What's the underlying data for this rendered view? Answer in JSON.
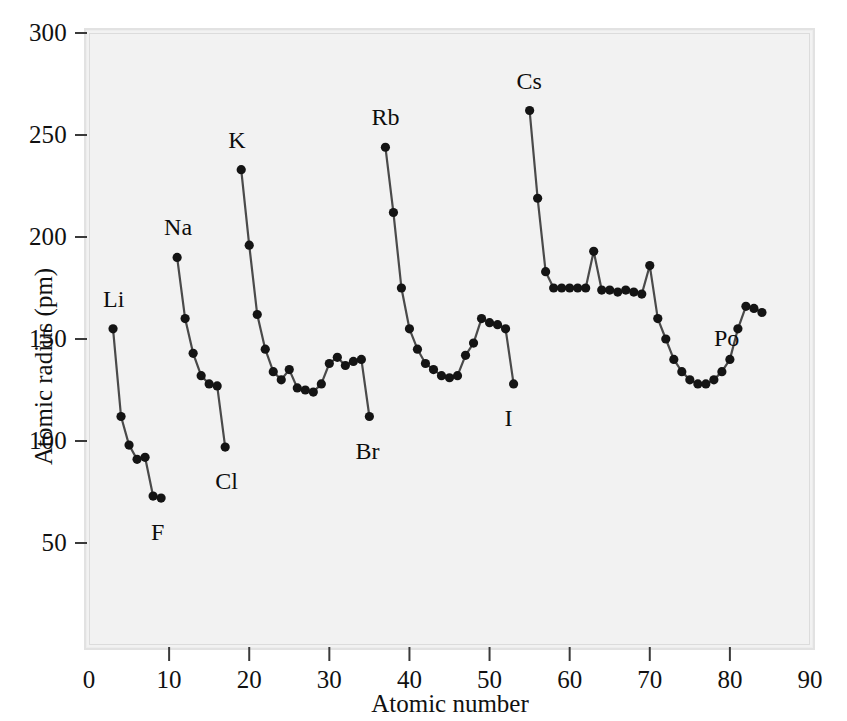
{
  "chart_data": {
    "type": "line",
    "title": "",
    "xlabel": "Atomic number",
    "ylabel": "Atomic radius (pm)",
    "xlim": [
      0,
      90
    ],
    "ylim": [
      0,
      300
    ],
    "xticks": [
      0,
      10,
      20,
      30,
      40,
      50,
      60,
      70,
      80,
      90
    ],
    "yticks": [
      50,
      100,
      150,
      200,
      250,
      300
    ],
    "grid": false,
    "legend": "none",
    "marker": "filled-circle",
    "series": [
      {
        "name": "period-2",
        "x": [
          3,
          4,
          5,
          6,
          7,
          8,
          9
        ],
        "values": [
          155,
          112,
          98,
          91,
          92,
          73,
          72
        ]
      },
      {
        "name": "period-3",
        "x": [
          11,
          12,
          13,
          14,
          15,
          16,
          17
        ],
        "values": [
          190,
          160,
          143,
          132,
          128,
          127,
          97
        ]
      },
      {
        "name": "period-4",
        "x": [
          19,
          20,
          21,
          22,
          23,
          24,
          25,
          26,
          27,
          28,
          29,
          30,
          31,
          32,
          33,
          34,
          35
        ],
        "values": [
          233,
          196,
          162,
          145,
          134,
          130,
          135,
          126,
          125,
          124,
          128,
          138,
          141,
          137,
          139,
          140,
          112
        ]
      },
      {
        "name": "period-5",
        "x": [
          37,
          38,
          39,
          40,
          41,
          42,
          43,
          44,
          45,
          46,
          47,
          48,
          49,
          50,
          51,
          52,
          53
        ],
        "values": [
          244,
          212,
          175,
          155,
          145,
          138,
          135,
          132,
          131,
          132,
          142,
          148,
          160,
          158,
          157,
          155,
          128
        ]
      },
      {
        "name": "period-6",
        "x": [
          55,
          56,
          57,
          58,
          59,
          60,
          61,
          62,
          63,
          64,
          65,
          66,
          67,
          68,
          69,
          70,
          71,
          72,
          73,
          74,
          75,
          76,
          77,
          78,
          79,
          80,
          81,
          82,
          83,
          84
        ],
        "values": [
          262,
          219,
          183,
          175,
          175,
          175,
          175,
          175,
          193,
          174,
          174,
          173,
          174,
          173,
          172,
          186,
          160,
          150,
          140,
          134,
          130,
          128,
          128,
          130,
          134,
          140,
          155,
          166,
          165,
          163
        ]
      }
    ],
    "point_labels": [
      {
        "text": "Li",
        "x": 3,
        "y": 155,
        "dx": -2,
        "dy": -30
      },
      {
        "text": "F",
        "x": 9,
        "y": 72,
        "dx": -2,
        "dy": 34
      },
      {
        "text": "Na",
        "x": 11,
        "y": 190,
        "dx": -5,
        "dy": -30
      },
      {
        "text": "Cl",
        "x": 17,
        "y": 97,
        "dx": -2,
        "dy": 34
      },
      {
        "text": "K",
        "x": 19,
        "y": 233,
        "dx": -5,
        "dy": -30
      },
      {
        "text": "Br",
        "x": 35,
        "y": 112,
        "dx": -6,
        "dy": 34
      },
      {
        "text": "Rb",
        "x": 37,
        "y": 244,
        "dx": -6,
        "dy": -30
      },
      {
        "text": "I",
        "x": 53,
        "y": 128,
        "dx": -1,
        "dy": 34
      },
      {
        "text": "Cs",
        "x": 55,
        "y": 262,
        "dx": -5,
        "dy": -30
      },
      {
        "text": "Po",
        "x": 83,
        "y": 165,
        "dx": -32,
        "dy": 30
      }
    ]
  },
  "axes": {
    "x_title": "Atomic number",
    "y_title": "Atomic radius (pm)",
    "x_tick_labels": [
      "0",
      "10",
      "20",
      "30",
      "40",
      "50",
      "60",
      "70",
      "80",
      "90"
    ],
    "y_tick_labels": [
      "50",
      "100",
      "150",
      "200",
      "250",
      "300"
    ]
  },
  "style": {
    "line_color": "#4a4a4a",
    "marker_color": "#141414",
    "plot_background": "#f2f2f2",
    "frame_color": "#e0e0e0",
    "text_color": "#111111"
  }
}
